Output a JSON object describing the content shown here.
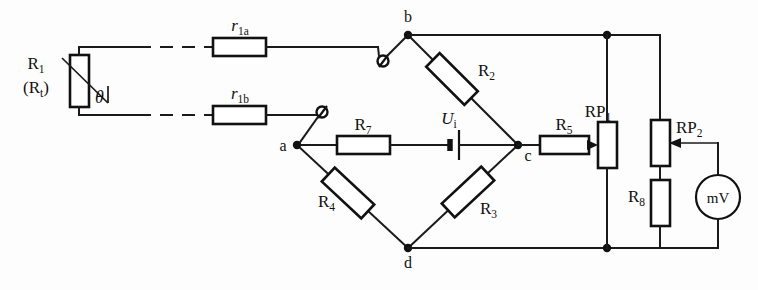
{
  "diagram": {
    "background_color": "#fdfdfd",
    "line_color": "#111111"
  },
  "components": {
    "thermistor": {
      "name": "R1",
      "label_main": "R",
      "label_main_sub": "1",
      "label_alt_open": "(R",
      "label_alt_sub": "t",
      "label_alt_close": ")",
      "theta_symbol": "θ"
    },
    "lead_a": {
      "label": "r",
      "sub": "1a"
    },
    "lead_b": {
      "label": "r",
      "sub": "1b"
    },
    "r2": {
      "label": "R",
      "sub": "2"
    },
    "r3": {
      "label": "R",
      "sub": "3"
    },
    "r4": {
      "label": "R",
      "sub": "4"
    },
    "r5": {
      "label": "R",
      "sub": "5"
    },
    "r7": {
      "label": "R",
      "sub": "7"
    },
    "r8": {
      "label": "R",
      "sub": "8"
    },
    "rp1": {
      "label": "RP",
      "sub": "1"
    },
    "rp2": {
      "label": "RP",
      "sub": "2"
    },
    "source": {
      "label": "U",
      "sub": "i"
    },
    "meter": {
      "label": "mV"
    }
  },
  "nodes": {
    "b": "b",
    "a": "a",
    "c": "c",
    "d": "d"
  }
}
